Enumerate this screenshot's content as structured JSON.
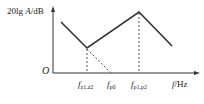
{
  "diagram": {
    "type": "bode-magnitude-asymptotic-plot",
    "y_axis": {
      "label_prefix": "20lg ",
      "label_var": "A",
      "label_unit": "/dB"
    },
    "x_axis": {
      "label_var": "f",
      "label_unit": "/Hz"
    },
    "origin_label": "O",
    "x_ticks": [
      {
        "main": "f",
        "sub": "z1,z2"
      },
      {
        "main": "f",
        "sub": "p0"
      },
      {
        "main": "f",
        "sub": "p1,p2"
      }
    ],
    "colors": {
      "line": "#333333",
      "dashed": "#555555",
      "axis": "#333333"
    },
    "segments": [
      {
        "name": "falling-segment",
        "from": [
          61,
          22
        ],
        "to": [
          87,
          48
        ]
      },
      {
        "name": "rising-segment",
        "from": [
          87,
          48
        ],
        "to": [
          139,
          12
        ]
      },
      {
        "name": "falling-segment-2",
        "from": [
          139,
          12
        ],
        "to": [
          172,
          46
        ]
      }
    ]
  }
}
